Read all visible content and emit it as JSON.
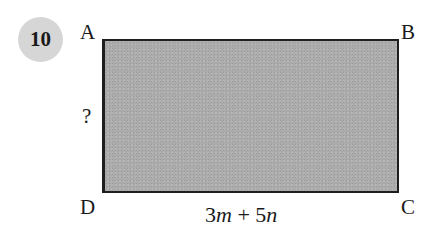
{
  "question": {
    "number": "10",
    "shape": "rectangle",
    "fill_color": "#ababab",
    "vertices": {
      "A": "A",
      "B": "B",
      "C": "C",
      "D": "D"
    },
    "side_unknown_label": "?",
    "bottom_side": {
      "coef1": "3",
      "var1": "m",
      "op": " + ",
      "coef2": "5",
      "var2": "n"
    }
  }
}
